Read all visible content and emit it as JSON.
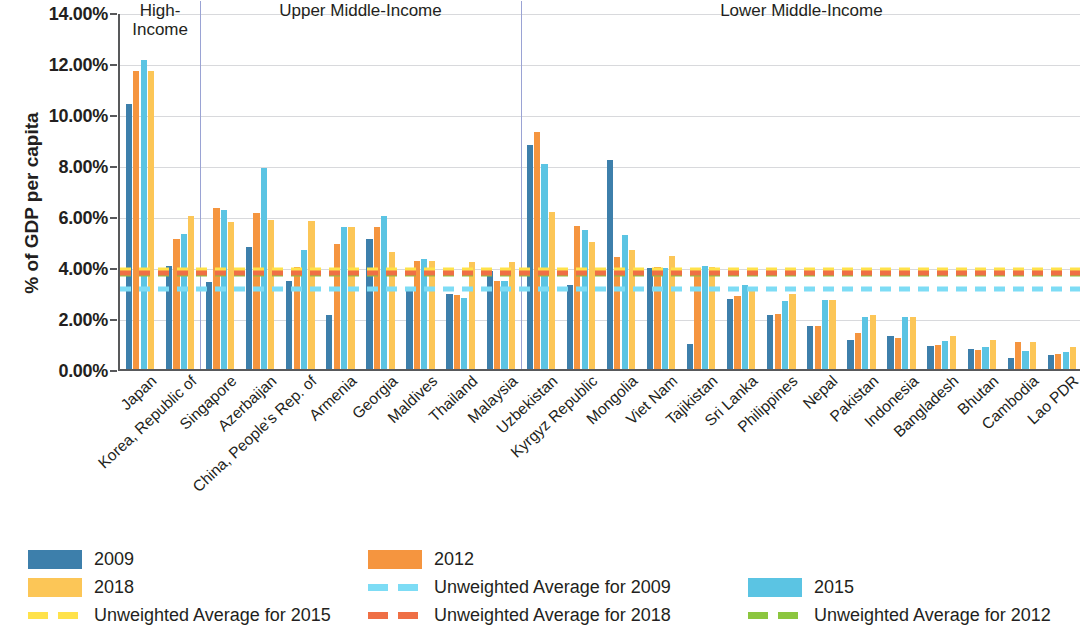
{
  "chart_data": {
    "type": "bar",
    "title": "",
    "xlabel": "",
    "ylabel": "% of GDP per capita",
    "ylim": [
      0,
      14
    ],
    "ytick_labels": [
      "0.00%",
      "2.00%",
      "4.00%",
      "6.00%",
      "8.00%",
      "10.00%",
      "12.00%",
      "14.00%"
    ],
    "ytick_values": [
      0,
      2,
      4,
      6,
      8,
      10,
      12,
      14
    ],
    "grid": true,
    "legend_position": "bottom",
    "categories": [
      "Japan",
      "Korea, Republic of",
      "Singapore",
      "Azerbaijan",
      "China, People's Rep. of",
      "Armenia",
      "Georgia",
      "Maldives",
      "Thailand",
      "Malaysia",
      "Uzbekistan",
      "Kyrgyz Republic",
      "Mongolia",
      "Viet Nam",
      "Tajikistan",
      "Sri Lanka",
      "Philippines",
      "Nepal",
      "Pakistan",
      "Indonesia",
      "Bangladesh",
      "Bhutan",
      "Cambodia",
      "Lao PDR"
    ],
    "series": [
      {
        "name": "2009",
        "color": "#3d7fab",
        "values": [
          10.4,
          4.05,
          3.4,
          4.8,
          3.45,
          2.1,
          5.1,
          3.05,
          2.95,
          3.85,
          8.8,
          3.3,
          8.2,
          3.95,
          1.0,
          2.75,
          2.1,
          1.7,
          1.15,
          1.3,
          0.9,
          0.8,
          0.45,
          0.55
        ]
      },
      {
        "name": "2012",
        "color": "#f5953f",
        "values": [
          11.7,
          5.1,
          6.3,
          6.1,
          4.0,
          4.9,
          5.55,
          4.25,
          2.9,
          3.45,
          9.3,
          5.6,
          4.4,
          4.0,
          3.95,
          2.85,
          2.15,
          1.7,
          1.4,
          1.2,
          0.95,
          0.75,
          1.05,
          0.6
        ]
      },
      {
        "name": "2015",
        "color": "#5bc4e3",
        "values": [
          12.1,
          5.3,
          6.25,
          7.9,
          4.65,
          5.55,
          6.0,
          4.3,
          2.8,
          3.45,
          8.05,
          5.45,
          5.25,
          3.95,
          4.05,
          3.3,
          2.65,
          2.7,
          2.05,
          2.05,
          1.1,
          0.85,
          0.7,
          0.65
        ]
      },
      {
        "name": "2018",
        "color": "#fcc657",
        "values": [
          11.7,
          6.0,
          5.75,
          5.85,
          5.8,
          5.55,
          4.6,
          4.25,
          4.2,
          4.2,
          6.15,
          5.0,
          4.65,
          4.45,
          4.0,
          3.15,
          2.95,
          2.7,
          2.1,
          2.05,
          1.3,
          1.15,
          1.05,
          0.85
        ]
      }
    ],
    "reference_lines": [
      {
        "name": "Unweighted Average for 2009",
        "value": 3.4,
        "color": "#7ddcf5"
      },
      {
        "name": "Unweighted Average for 2012",
        "value": 4.0,
        "color": "#8cc63f"
      },
      {
        "name": "Unweighted Average for 2015",
        "value": 4.15,
        "color": "#ffe24a"
      },
      {
        "name": "Unweighted Average for 2018",
        "value": 4.05,
        "color": "#ef6f45"
      }
    ],
    "groups": [
      {
        "label": "High-\nIncome",
        "label_line1": "High-",
        "label_line2": "Income",
        "start": 0,
        "end": 2
      },
      {
        "label": "Upper Middle-Income",
        "label_line1": "Upper Middle-Income",
        "label_line2": "",
        "start": 2,
        "end": 10
      },
      {
        "label": "Lower Middle-Income",
        "label_line1": "Lower Middle-Income",
        "label_line2": "",
        "start": 10,
        "end": 24
      }
    ]
  },
  "legend": {
    "items": [
      {
        "label": "2009",
        "kind": "bar",
        "swatch": "sw-2009",
        "col": 0,
        "row": 0
      },
      {
        "label": "2012",
        "kind": "bar",
        "swatch": "sw-2012",
        "col": 1,
        "row": 0
      },
      {
        "label": "2015",
        "kind": "bar",
        "swatch": "sw-2015",
        "col": 2,
        "row": 1
      },
      {
        "label": "2018",
        "kind": "bar",
        "swatch": "sw-2018",
        "col": 0,
        "row": 1
      },
      {
        "label": "Unweighted Average for 2009",
        "kind": "dash",
        "swatch": "sw-u2009",
        "col": 1,
        "row": 1
      },
      {
        "label": "Unweighted Average for 2012",
        "kind": "dash",
        "swatch": "sw-u2012",
        "col": 2,
        "row": 2
      },
      {
        "label": "Unweighted Average for 2015",
        "kind": "dash",
        "swatch": "sw-u2015",
        "col": 0,
        "row": 2
      },
      {
        "label": "Unweighted Average for 2018",
        "kind": "dash",
        "swatch": "sw-u2018",
        "col": 1,
        "row": 2
      }
    ]
  }
}
